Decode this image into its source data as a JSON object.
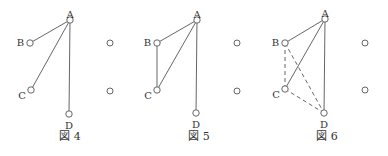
{
  "figures": [
    {
      "caption": "図 4",
      "nodes": {
        "A": [
          70,
          20
        ],
        "B": [
          30,
          43
        ],
        "C": [
          31,
          90
        ],
        "D": [
          69,
          114
        ]
      },
      "extra": [
        [
          110,
          43
        ],
        [
          110,
          91
        ]
      ],
      "solid_edges": [
        [
          "A",
          "B"
        ],
        [
          "A",
          "C"
        ],
        [
          "A",
          "D"
        ]
      ],
      "dashed_edges": [],
      "caption_pos": [
        70,
        140
      ]
    },
    {
      "caption": "図 5",
      "nodes": {
        "A": [
          197,
          20
        ],
        "B": [
          157,
          43
        ],
        "C": [
          157,
          90
        ],
        "D": [
          196,
          113
        ]
      },
      "extra": [
        [
          237,
          43
        ],
        [
          237,
          91
        ]
      ],
      "solid_edges": [
        [
          "A",
          "B"
        ],
        [
          "A",
          "C"
        ],
        [
          "A",
          "D"
        ],
        [
          "B",
          "C"
        ]
      ],
      "dashed_edges": [],
      "caption_pos": [
        199,
        140
      ]
    },
    {
      "caption": "図 6",
      "nodes": {
        "A": [
          325,
          19
        ],
        "B": [
          285,
          43
        ],
        "C": [
          285,
          89
        ],
        "D": [
          324,
          113
        ]
      },
      "extra": [
        [
          365,
          43
        ],
        [
          365,
          90
        ]
      ],
      "solid_edges": [
        [
          "A",
          "B"
        ],
        [
          "A",
          "C"
        ],
        [
          "A",
          "D"
        ]
      ],
      "dashed_edges": [
        [
          "B",
          "C"
        ],
        [
          "B",
          "D"
        ],
        [
          "C",
          "D"
        ]
      ],
      "caption_pos": [
        327,
        140
      ]
    }
  ],
  "labels": {
    "A": "A",
    "B": "B",
    "C": "C",
    "D": "D"
  }
}
